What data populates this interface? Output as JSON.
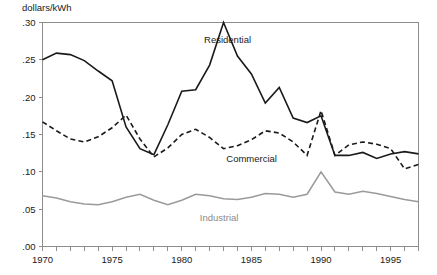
{
  "chart_data": {
    "type": "line",
    "title": "",
    "subtitle": "",
    "xlabel": "",
    "ylabel": "dollars/kWh",
    "ylim": [
      0.0,
      0.3
    ],
    "xlim": [
      1970,
      1997
    ],
    "grid": false,
    "legend_position": "inline-annotations",
    "y_ticks": [
      0.0,
      0.05,
      0.1,
      0.15,
      0.2,
      0.25,
      0.3
    ],
    "y_tick_labels": [
      ".00",
      ".05",
      ".10",
      ".15",
      ".20",
      ".25",
      ".30"
    ],
    "x_ticks": [
      1970,
      1971,
      1972,
      1973,
      1974,
      1975,
      1976,
      1977,
      1978,
      1979,
      1980,
      1981,
      1982,
      1983,
      1984,
      1985,
      1986,
      1987,
      1988,
      1989,
      1990,
      1991,
      1992,
      1993,
      1994,
      1995,
      1996,
      1997
    ],
    "x_tick_labels": [
      {
        "value": 1970,
        "label": "1970"
      },
      {
        "value": 1975,
        "label": "1975"
      },
      {
        "value": 1980,
        "label": "1980"
      },
      {
        "value": 1985,
        "label": "1985"
      },
      {
        "value": 1990,
        "label": "1990"
      },
      {
        "value": 1995,
        "label": "1995"
      }
    ],
    "x": [
      1970,
      1971,
      1972,
      1973,
      1974,
      1975,
      1976,
      1977,
      1978,
      1979,
      1980,
      1981,
      1982,
      1983,
      1984,
      1985,
      1986,
      1987,
      1988,
      1989,
      1990,
      1991,
      1992,
      1993,
      1994,
      1995,
      1996,
      1997
    ],
    "series": [
      {
        "name": "Residential",
        "style": "solid",
        "color": "#1a1a1a",
        "width": 1.6,
        "label": "Residential",
        "label_x": 1981.6,
        "label_y": 0.272,
        "values": [
          0.25,
          0.259,
          0.257,
          0.249,
          0.235,
          0.222,
          0.16,
          0.131,
          0.123,
          0.163,
          0.208,
          0.21,
          0.243,
          0.3,
          0.255,
          0.231,
          0.192,
          0.213,
          0.172,
          0.166,
          0.175,
          0.122,
          0.122,
          0.126,
          0.118,
          0.124,
          0.127,
          0.124
        ]
      },
      {
        "name": "Commercial",
        "style": "dashed",
        "color": "#1a1a1a",
        "width": 1.6,
        "dash": "5,3.2",
        "label": "Commercial",
        "label_x": 1983.2,
        "label_y": 0.113,
        "values": [
          0.167,
          0.155,
          0.144,
          0.14,
          0.147,
          0.159,
          0.176,
          0.144,
          0.12,
          0.132,
          0.15,
          0.157,
          0.146,
          0.131,
          0.135,
          0.143,
          0.155,
          0.152,
          0.14,
          0.122,
          0.182,
          0.122,
          0.136,
          0.14,
          0.137,
          0.131,
          0.104,
          0.11
        ]
      },
      {
        "name": "Industrial",
        "style": "solid",
        "color": "#9a9a9a",
        "width": 1.5,
        "label": "Industrial",
        "label_x": 1981.3,
        "label_y": 0.034,
        "values": [
          0.068,
          0.065,
          0.06,
          0.057,
          0.056,
          0.06,
          0.066,
          0.07,
          0.062,
          0.056,
          0.062,
          0.07,
          0.068,
          0.064,
          0.063,
          0.066,
          0.071,
          0.07,
          0.066,
          0.07,
          0.1,
          0.073,
          0.07,
          0.074,
          0.071,
          0.067,
          0.063,
          0.06
        ]
      }
    ]
  }
}
